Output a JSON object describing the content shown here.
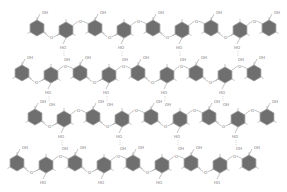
{
  "diagram": {
    "type": "chemical-structure",
    "colors": {
      "ring_fill": "#6f6f6f",
      "bond": "#9a9a9a",
      "label": "#777777",
      "hbond": "#aaaaaa"
    },
    "labels": {
      "hydroxyl": "OH",
      "hydroxyl_rev": "HO",
      "bridge": "O"
    },
    "rows": [
      {
        "y": 28,
        "x0": 37,
        "step": 29,
        "count": 9,
        "zig": 2
      },
      {
        "y": 73,
        "x0": 22,
        "step": 29,
        "count": 9,
        "zig": 2
      },
      {
        "y": 117,
        "x0": 35,
        "step": 29,
        "count": 9,
        "zig": 2
      },
      {
        "y": 163,
        "x0": 17,
        "step": 29,
        "count": 9,
        "zig": 2
      }
    ]
  }
}
